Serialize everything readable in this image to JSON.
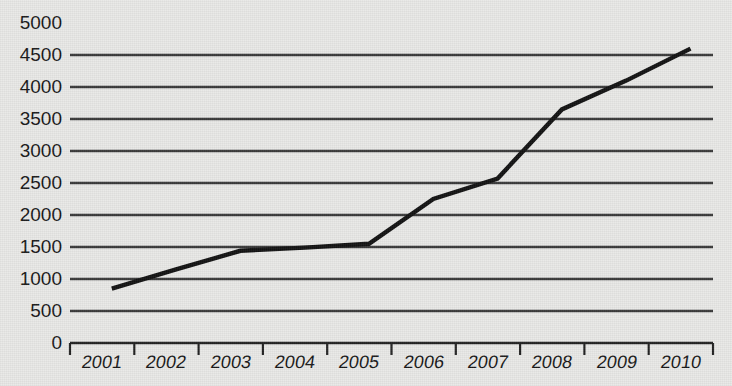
{
  "chart_data": {
    "type": "line",
    "title": "",
    "xlabel": "",
    "ylabel": "",
    "x": [
      2001,
      2002,
      2003,
      2004,
      2005,
      2006,
      2007,
      2008,
      2009,
      2010
    ],
    "categories": [
      "2001",
      "2002",
      "2003",
      "2004",
      "2005",
      "2006",
      "2007",
      "2008",
      "2009",
      "2010"
    ],
    "values": [
      850,
      1150,
      1440,
      1490,
      1550,
      2250,
      2570,
      3650,
      4100,
      4600
    ],
    "series": [
      {
        "name": "series-1",
        "values": [
          850,
          1150,
          1440,
          1490,
          1550,
          2250,
          2570,
          3650,
          4100,
          4600
        ]
      }
    ],
    "ylim": [
      0,
      5000
    ],
    "ytick_values": [
      0,
      500,
      1000,
      1500,
      2000,
      2500,
      3000,
      3500,
      4000,
      4500,
      5000
    ],
    "ytick_labels": [
      "0",
      "500",
      "1000",
      "1500",
      "2000",
      "2500",
      "3000",
      "3500",
      "4000",
      "4500",
      "5000"
    ],
    "xtick_labels": [
      "2001",
      "2002",
      "2003",
      "2004",
      "2005",
      "2006",
      "2007",
      "2008",
      "2009",
      "2010"
    ],
    "grid": "horizontal",
    "legend": "none",
    "line_color": "#121212",
    "grid_color": "#3a3a3a",
    "axis_color": "#222222",
    "background_color": "#e9e9e7"
  }
}
